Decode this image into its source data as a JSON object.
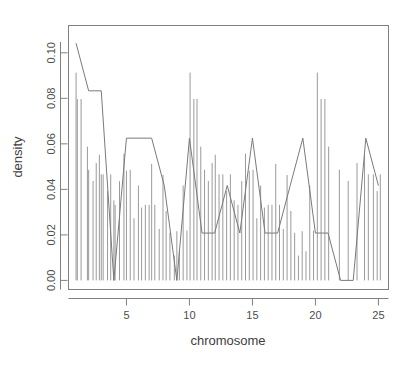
{
  "chart_data": {
    "type": "line",
    "title": "",
    "xlabel": "chromosome",
    "ylabel": "density",
    "xlim": [
      0.4,
      25.8
    ],
    "ylim": [
      -0.004,
      0.112
    ],
    "grid": false,
    "legend": null,
    "x_ticks": [
      5,
      10,
      15,
      20,
      25
    ],
    "x_tick_labels": [
      "5",
      "10",
      "15",
      "20",
      "25"
    ],
    "y_ticks": [
      0.0,
      0.02,
      0.04,
      0.06,
      0.08,
      0.1
    ],
    "y_tick_labels": [
      "0.00",
      "0.02",
      "0.04",
      "0.06",
      "0.08",
      "0.10"
    ],
    "series": [
      {
        "name": "density",
        "type": "line",
        "x": [
          1,
          2,
          3,
          4,
          5,
          6,
          7,
          8,
          9,
          10,
          11,
          12,
          13,
          14,
          15,
          16,
          17,
          18,
          19,
          20,
          21,
          22,
          23,
          24,
          25
        ],
        "values": [
          0.1042,
          0.0833,
          0.0833,
          0.0,
          0.0625,
          0.0625,
          0.0625,
          0.0417,
          0.0,
          0.0625,
          0.0208,
          0.0208,
          0.0417,
          0.0208,
          0.0625,
          0.0208,
          0.0208,
          0.0417,
          0.0625,
          0.0208,
          0.0208,
          0.0,
          0.0,
          0.0625,
          0.0417
        ]
      },
      {
        "name": "rug",
        "type": "spikes",
        "x": [
          1.0,
          1.1,
          1.4,
          1.9,
          2.0,
          2.35,
          2.6,
          2.85,
          3.0,
          3.15,
          3.5,
          3.75,
          4.0,
          4.1,
          4.45,
          4.8,
          5.0,
          5.3,
          5.6,
          5.95,
          6.2,
          6.5,
          6.8,
          7.0,
          7.25,
          7.6,
          7.9,
          8.15,
          8.45,
          8.8,
          9.0,
          9.2,
          9.5,
          9.8,
          10.05,
          10.35,
          10.6,
          10.9,
          11.2,
          11.5,
          11.8,
          12.05,
          12.35,
          12.65,
          12.95,
          13.25,
          13.55,
          13.85,
          14.15,
          14.45,
          14.75,
          15.05,
          15.35,
          15.65,
          15.95,
          16.25,
          16.55,
          16.85,
          17.15,
          17.45,
          17.75,
          18.05,
          18.35,
          18.65,
          18.95,
          19.25,
          19.55,
          19.85,
          20.15,
          20.45,
          20.75,
          21.05,
          21.9,
          22.6,
          23.3,
          23.9,
          24.2,
          24.6,
          24.9,
          25.15
        ],
        "heights": [
          0.0913,
          0.0797,
          0.0797,
          0.0588,
          0.0486,
          0.0437,
          0.0516,
          0.0552,
          0.0466,
          0.0466,
          0.0393,
          0.0466,
          0.0352,
          0.0332,
          0.0436,
          0.0557,
          0.0482,
          0.0486,
          0.0273,
          0.0417,
          0.032,
          0.0332,
          0.0332,
          0.0512,
          0.0332,
          0.0226,
          0.0463,
          0.0305,
          0.0209,
          0.0109,
          0.0216,
          0.0128,
          0.0417,
          0.0219
        ]
      }
    ],
    "annotations": []
  },
  "axes": {
    "y_title": "density",
    "x_title": "chromosome"
  },
  "figure": {
    "background_color": "#ffffff",
    "line_color": "#7a7a7a",
    "rug_color": "#9a9a9a",
    "box_color": "#808080",
    "text_color": "#4d4d4d"
  }
}
